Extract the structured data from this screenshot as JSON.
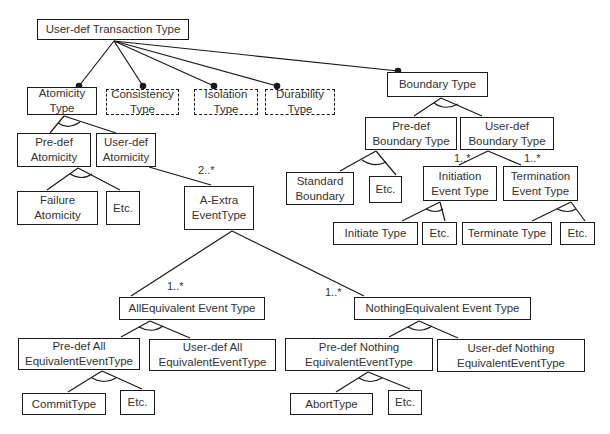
{
  "diagram": {
    "type": "feature-model",
    "nodes": [
      {
        "id": "root",
        "label": "User-def Transaction Type",
        "x": 37,
        "y": 19,
        "w": 152,
        "h": 21,
        "style": "solid"
      },
      {
        "id": "atomicity",
        "label": "Atomicity\nType",
        "x": 27,
        "y": 87,
        "w": 70,
        "h": 28,
        "style": "solid"
      },
      {
        "id": "consistency",
        "label": "Consistency\nType",
        "x": 106,
        "y": 89,
        "w": 73,
        "h": 26,
        "style": "dashed"
      },
      {
        "id": "isolation",
        "label": "Isolation\nType",
        "x": 194,
        "y": 89,
        "w": 64,
        "h": 26,
        "style": "dashed"
      },
      {
        "id": "durability",
        "label": "Durability\nType",
        "x": 265,
        "y": 89,
        "w": 70,
        "h": 26,
        "style": "dashed"
      },
      {
        "id": "boundary",
        "label": "Boundary Type",
        "x": 387,
        "y": 72,
        "w": 101,
        "h": 25,
        "style": "solid"
      },
      {
        "id": "predef_atomicity",
        "label": "Pre-def\nAtomicity",
        "x": 17,
        "y": 133,
        "w": 74,
        "h": 34,
        "style": "solid"
      },
      {
        "id": "userdef_atomicity",
        "label": "User-def\nAtomicity",
        "x": 96,
        "y": 133,
        "w": 60,
        "h": 34,
        "style": "solid"
      },
      {
        "id": "failure_atomicity",
        "label": "Failure\nAtomicity",
        "x": 17,
        "y": 191,
        "w": 81,
        "h": 34,
        "style": "solid"
      },
      {
        "id": "atomicity_etc",
        "label": "Etc.",
        "x": 106,
        "y": 191,
        "w": 34,
        "h": 34,
        "style": "solid"
      },
      {
        "id": "a_extra",
        "label": "A-Extra\nEventType",
        "x": 184,
        "y": 186,
        "w": 70,
        "h": 44,
        "style": "solid"
      },
      {
        "id": "predef_boundary",
        "label": "Pre-def\nBoundary Type",
        "x": 365,
        "y": 117,
        "w": 92,
        "h": 33,
        "style": "solid"
      },
      {
        "id": "userdef_boundary",
        "label": "User-def\nBoundary Type",
        "x": 460,
        "y": 117,
        "w": 94,
        "h": 33,
        "style": "solid"
      },
      {
        "id": "standard_boundary",
        "label": "Standard\nBoundary",
        "x": 286,
        "y": 172,
        "w": 68,
        "h": 33,
        "style": "solid"
      },
      {
        "id": "boundary_etc",
        "label": "Etc.",
        "x": 369,
        "y": 176,
        "w": 33,
        "h": 27,
        "style": "solid"
      },
      {
        "id": "initiation",
        "label": "Initiation\nEvent Type",
        "x": 423,
        "y": 166,
        "w": 74,
        "h": 35,
        "style": "solid"
      },
      {
        "id": "termination",
        "label": "Termination\nEvent Type",
        "x": 503,
        "y": 166,
        "w": 75,
        "h": 35,
        "style": "solid"
      },
      {
        "id": "initiate_type",
        "label": "Initiate Type",
        "x": 333,
        "y": 222,
        "w": 85,
        "h": 23,
        "style": "solid"
      },
      {
        "id": "initiation_etc",
        "label": "Etc.",
        "x": 422,
        "y": 222,
        "w": 35,
        "h": 23,
        "style": "solid"
      },
      {
        "id": "terminate_type",
        "label": "Terminate Type",
        "x": 462,
        "y": 222,
        "w": 90,
        "h": 23,
        "style": "solid"
      },
      {
        "id": "termination_etc",
        "label": "Etc.",
        "x": 560,
        "y": 222,
        "w": 35,
        "h": 23,
        "style": "solid"
      },
      {
        "id": "all_equivalent",
        "label": "AllEquivalent Event Type",
        "x": 119,
        "y": 297,
        "w": 146,
        "h": 23,
        "style": "solid"
      },
      {
        "id": "nothing_equivalent",
        "label": "NothingEquivalent Event Type",
        "x": 354,
        "y": 297,
        "w": 177,
        "h": 23,
        "style": "solid"
      },
      {
        "id": "predef_all",
        "label": "Pre-def All\nEquivalentEventType",
        "x": 18,
        "y": 338,
        "w": 122,
        "h": 32,
        "style": "solid"
      },
      {
        "id": "userdef_all",
        "label": "User-def All\nEquivalentEventType",
        "x": 149,
        "y": 339,
        "w": 127,
        "h": 32,
        "style": "solid"
      },
      {
        "id": "predef_nothing",
        "label": "Pre-def Nothing\nEquivalentEventType",
        "x": 285,
        "y": 338,
        "w": 148,
        "h": 33,
        "style": "solid"
      },
      {
        "id": "userdef_nothing",
        "label": "User-def Nothing\nEquivalentEventType",
        "x": 437,
        "y": 339,
        "w": 148,
        "h": 33,
        "style": "solid"
      },
      {
        "id": "commit_type",
        "label": "CommitType",
        "x": 22,
        "y": 393,
        "w": 84,
        "h": 22,
        "style": "solid"
      },
      {
        "id": "commit_etc",
        "label": "Etc.",
        "x": 120,
        "y": 390,
        "w": 35,
        "h": 25,
        "style": "solid"
      },
      {
        "id": "abort_type",
        "label": "AbortType",
        "x": 290,
        "y": 393,
        "w": 83,
        "h": 22,
        "style": "solid"
      },
      {
        "id": "abort_etc",
        "label": "Etc.",
        "x": 388,
        "y": 390,
        "w": 34,
        "h": 25,
        "style": "solid"
      }
    ],
    "multiplicities": [
      {
        "label": "2..*",
        "x": 198,
        "y": 164
      },
      {
        "label": "1..*",
        "x": 454,
        "y": 152
      },
      {
        "label": "1..*",
        "x": 524,
        "y": 152
      },
      {
        "label": "1..*",
        "x": 167,
        "y": 280
      },
      {
        "label": "1..*",
        "x": 325,
        "y": 286
      }
    ],
    "colors": {
      "stroke": "#1a1a1a",
      "text": "#333333",
      "background": "#ffffff"
    }
  }
}
